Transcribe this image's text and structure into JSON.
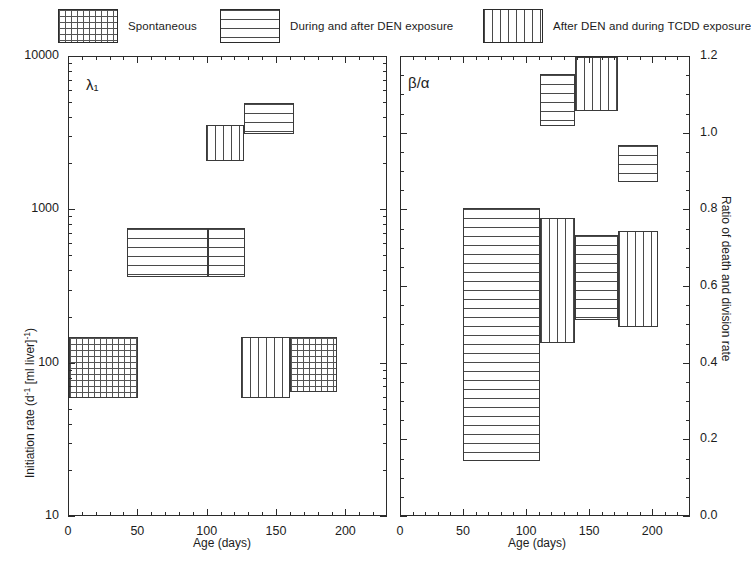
{
  "figure": {
    "legend": [
      {
        "label": "Spontaneous",
        "pattern": "grid"
      },
      {
        "label": "During and after DEN exposure",
        "pattern": "horizontal"
      },
      {
        "label": "After DEN and during TCDD exposure",
        "pattern": "vertical"
      }
    ]
  },
  "chart_data": [
    {
      "type": "bar",
      "panel": "left",
      "annotation": "λ₁",
      "title": "",
      "xlabel": "Age (days)",
      "ylabel": "Initiation rate (d⁻¹ [ml liver]⁻¹)",
      "xlim": [
        0,
        230
      ],
      "ylim": [
        10,
        10000
      ],
      "yscale": "log",
      "xticks": [
        0,
        50,
        100,
        150,
        200
      ],
      "yticks": [
        10,
        100,
        1000,
        10000
      ],
      "ytick_labels": [
        "10",
        "100",
        "1000",
        "10000"
      ],
      "grid": false,
      "blocks": [
        {
          "name": "spontaneous-0-50",
          "pattern": "grid",
          "x0": 0,
          "x1": 50,
          "y0": 60,
          "y1": 150
        },
        {
          "name": "den-50-100",
          "pattern": "horizontal",
          "x0": 42,
          "x1": 100,
          "y0": 370,
          "y1": 770
        },
        {
          "name": "den-100-150",
          "pattern": "horizontal",
          "x0": 100,
          "x1": 127,
          "y0": 370,
          "y1": 770
        },
        {
          "name": "tcdd-100-125",
          "pattern": "vertical",
          "x0": 99,
          "x1": 126,
          "y0": 2100,
          "y1": 3600
        },
        {
          "name": "den-125-160",
          "pattern": "horizontal",
          "x0": 126,
          "x1": 162,
          "y0": 3150,
          "y1": 5000
        },
        {
          "name": "tcdd-125-160",
          "pattern": "vertical",
          "x0": 124,
          "x1": 159,
          "y0": 60,
          "y1": 150
        },
        {
          "name": "spontaneous-160-195",
          "pattern": "grid",
          "x0": 159,
          "x1": 193,
          "y0": 65,
          "y1": 150
        }
      ]
    },
    {
      "type": "bar",
      "panel": "right",
      "annotation": "β/α",
      "title": "",
      "xlabel": "Age (days)",
      "ylabel": "Ratio of death and division rate",
      "xlim": [
        0,
        230
      ],
      "ylim": [
        0.0,
        1.2
      ],
      "yscale": "linear",
      "xticks": [
        0,
        50,
        100,
        150,
        200
      ],
      "yticks": [
        0.0,
        0.2,
        0.4,
        0.6,
        0.8,
        1.0,
        1.2
      ],
      "ytick_labels": [
        "0.0",
        "0.2",
        "0.4",
        "0.6",
        "0.8",
        "1.0",
        "1.2"
      ],
      "grid": false,
      "blocks": [
        {
          "name": "den-50-110-low",
          "pattern": "horizontal",
          "x0": 49,
          "x1": 110,
          "y0": 0.145,
          "y1": 0.805
        },
        {
          "name": "tcdd-110-138",
          "pattern": "vertical",
          "x0": 110,
          "x1": 138,
          "y0": 0.455,
          "y1": 0.78
        },
        {
          "name": "den-138-172",
          "pattern": "horizontal",
          "x0": 138,
          "x1": 172,
          "y0": 0.515,
          "y1": 0.735
        },
        {
          "name": "tcdd-172-204",
          "pattern": "vertical",
          "x0": 172,
          "x1": 204,
          "y0": 0.495,
          "y1": 0.745
        },
        {
          "name": "den-110-138-high",
          "pattern": "horizontal",
          "x0": 110,
          "x1": 138,
          "y0": 1.02,
          "y1": 1.155
        },
        {
          "name": "tcdd-138-172-high",
          "pattern": "vertical",
          "x0": 138,
          "x1": 172,
          "y0": 1.06,
          "y1": 1.2
        },
        {
          "name": "den-172-204-high",
          "pattern": "horizontal",
          "x0": 172,
          "x1": 204,
          "y0": 0.875,
          "y1": 0.97
        }
      ]
    }
  ]
}
